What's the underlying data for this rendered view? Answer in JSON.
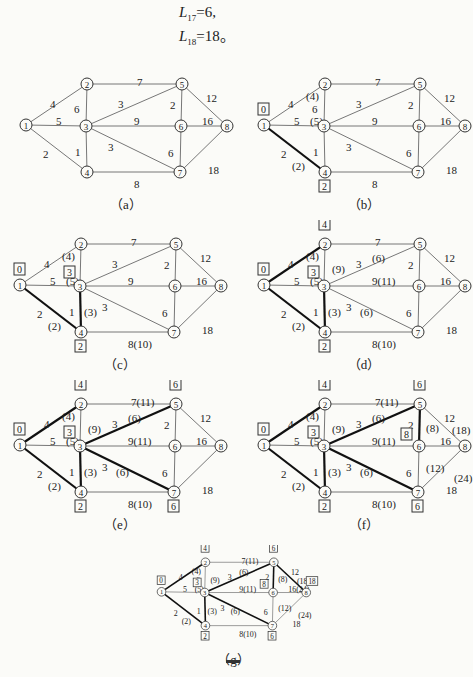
{
  "header": {
    "lines": [
      {
        "var": "L",
        "sub": "17",
        "rest": "=6,"
      },
      {
        "var": "L",
        "sub": "18",
        "rest": "=18。"
      }
    ]
  },
  "graph": {
    "nodes": [
      "1",
      "2",
      "3",
      "4",
      "5",
      "6",
      "7",
      "8"
    ],
    "edges": [
      {
        "id": "e12",
        "from": "1",
        "to": "2",
        "weight": "4"
      },
      {
        "id": "e13",
        "from": "1",
        "to": "3",
        "weight": "5"
      },
      {
        "id": "e14",
        "from": "1",
        "to": "4",
        "weight": "2"
      },
      {
        "id": "e23",
        "from": "2",
        "to": "3",
        "weight": "6"
      },
      {
        "id": "e25",
        "from": "2",
        "to": "5",
        "weight": "7"
      },
      {
        "id": "e34",
        "from": "3",
        "to": "4",
        "weight": "1"
      },
      {
        "id": "e35",
        "from": "3",
        "to": "5",
        "weight": "3"
      },
      {
        "id": "e36",
        "from": "3",
        "to": "6",
        "weight": "9"
      },
      {
        "id": "e37",
        "from": "3",
        "to": "7",
        "weight": "3"
      },
      {
        "id": "e47",
        "from": "4",
        "to": "7",
        "weight": "8"
      },
      {
        "id": "e56",
        "from": "5",
        "to": "6",
        "weight": "2"
      },
      {
        "id": "e58",
        "from": "5",
        "to": "8",
        "weight": "12"
      },
      {
        "id": "e67",
        "from": "6",
        "to": "7",
        "weight": "6"
      },
      {
        "id": "e68",
        "from": "6",
        "to": "8",
        "weight": "16"
      },
      {
        "id": "e78",
        "from": "7",
        "to": "8",
        "weight": "18"
      }
    ]
  },
  "panels": [
    {
      "caption": "（a）",
      "bold": [],
      "labels": {},
      "edge_labels": {}
    },
    {
      "caption": "（b）",
      "bold": [
        "e14"
      ],
      "labels": {
        "1": "0",
        "4": "2"
      },
      "edge_labels": {
        "e12": "(4)",
        "e13": "(5)",
        "e14": "(2)"
      }
    },
    {
      "caption": "（c）",
      "bold": [
        "e14",
        "e34"
      ],
      "labels": {
        "1": "0",
        "4": "2",
        "3": "3"
      },
      "edge_labels": {
        "e12": "(4)",
        "e13": "(5)",
        "e14": "(2)",
        "e34": "(3)",
        "e47": "(10)"
      }
    },
    {
      "caption": "（d）",
      "bold": [
        "e14",
        "e34",
        "e12"
      ],
      "labels": {
        "1": "0",
        "4": "2",
        "3": "3",
        "2": "4"
      },
      "edge_labels": {
        "e12": "(4)",
        "e13": "(5)",
        "e14": "(2)",
        "e34": "(3)",
        "e47": "(10)",
        "e23": "(9)",
        "e35": "(6)",
        "e36": "(11)",
        "e37": "(6)"
      }
    },
    {
      "caption": "（e）",
      "bold": [
        "e14",
        "e34",
        "e12",
        "e35",
        "e37"
      ],
      "labels": {
        "1": "0",
        "4": "2",
        "3": "3",
        "2": "4",
        "5": "6",
        "7": "6"
      },
      "edge_labels": {
        "e12": "(4)",
        "e13": "(5)",
        "e14": "(2)",
        "e34": "(3)",
        "e47": "(10)",
        "e23": "(9)",
        "e35": "(6)",
        "e36": "(11)",
        "e37": "(6)",
        "e25": "(11)"
      }
    },
    {
      "caption": "（f）",
      "bold": [
        "e14",
        "e34",
        "e12",
        "e35",
        "e37",
        "e56"
      ],
      "labels": {
        "1": "0",
        "4": "2",
        "3": "3",
        "2": "4",
        "5": "6",
        "7": "6",
        "6": "8"
      },
      "edge_labels": {
        "e12": "(4)",
        "e13": "(5)",
        "e14": "(2)",
        "e34": "(3)",
        "e47": "(10)",
        "e23": "(9)",
        "e35": "(6)",
        "e36": "(11)",
        "e37": "(6)",
        "e25": "(11)",
        "e56": "(8)",
        "e58": "(18)",
        "e67": "(12)",
        "e78": "(24)"
      }
    },
    {
      "caption": "（g）",
      "bold": [
        "e14",
        "e34",
        "e12",
        "e35",
        "e37",
        "e56",
        "e58"
      ],
      "labels": {
        "1": "0",
        "4": "2",
        "3": "3",
        "2": "4",
        "5": "6",
        "7": "6",
        "6": "8",
        "8": "18"
      },
      "edge_labels": {
        "e12": "(4)",
        "e13": "(5)",
        "e14": "(2)",
        "e34": "(3)",
        "e47": "(10)",
        "e23": "(9)",
        "e35": "(6)",
        "e36": "(11)",
        "e37": "(6)",
        "e25": "(11)",
        "e56": "(8)",
        "e58": "(18)",
        "e67": "(12)",
        "e78": "(24)",
        "e68": "(24)"
      }
    }
  ],
  "footer": {
    "mark": "—"
  }
}
